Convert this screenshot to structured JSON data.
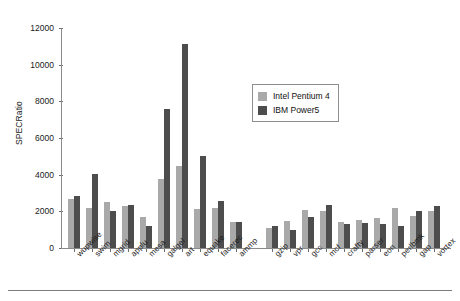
{
  "chart_data": {
    "type": "bar",
    "title": "",
    "xlabel": "",
    "ylabel": "SPECRatio",
    "ylim": [
      0,
      12000
    ],
    "yticks": [
      0,
      2000,
      4000,
      6000,
      8000,
      10000,
      12000
    ],
    "ytick_labels": [
      "0",
      "2000",
      "4000",
      "6000",
      "8000",
      "10000",
      "12000"
    ],
    "grid": false,
    "legend_position": "upper-center-right",
    "categories": [
      "wupwise",
      "swim",
      "mgrid",
      "applu",
      "mesa",
      "galgel",
      "art",
      "equake",
      "facerec",
      "ammp",
      "",
      "gzip",
      "vpr",
      "gcc",
      "mcf",
      "crafty",
      "parser",
      "eon",
      "perlbmk",
      "gap",
      "vortex"
    ],
    "series": [
      {
        "name": "Intel Pentium 4",
        "color": "#a9a9a9",
        "values": [
          2700,
          2200,
          2500,
          2300,
          1700,
          3750,
          4500,
          2150,
          2200,
          1400,
          null,
          1100,
          1500,
          2050,
          2000,
          1400,
          1550,
          1650,
          2200,
          1750,
          2000
        ]
      },
      {
        "name": "IBM Power5",
        "color": "#4d4d4d",
        "values": [
          2850,
          4050,
          2000,
          2350,
          1200,
          7600,
          11150,
          5000,
          2550,
          1400,
          null,
          1200,
          1000,
          1700,
          2350,
          1300,
          1350,
          1300,
          1200,
          2000,
          2300
        ]
      }
    ]
  },
  "legend": {
    "items": [
      {
        "label": "Intel Pentium 4",
        "swatch": "series-0"
      },
      {
        "label": "IBM Power5",
        "swatch": "series-1"
      }
    ]
  }
}
